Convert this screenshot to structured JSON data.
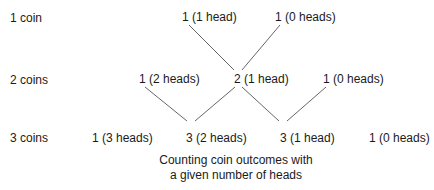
{
  "rows": [
    {
      "label": "1 coin",
      "nodes": [
        "1 (1 head)",
        "1 (0 heads)"
      ]
    },
    {
      "label": "2 coins",
      "nodes": [
        "1 (2 heads)",
        "2 (1 head)",
        "1 (0 heads)"
      ]
    },
    {
      "label": "3 coins",
      "nodes": [
        "1 (3 heads)",
        "3 (2 heads)",
        "3 (1 head)",
        "1 (0 heads)"
      ]
    }
  ],
  "caption": {
    "line1": "Counting coin outcomes with",
    "line2": "a given number of heads"
  },
  "colors": {
    "text": "#1a1a1a",
    "line": "#555555",
    "background": "#ffffff"
  }
}
